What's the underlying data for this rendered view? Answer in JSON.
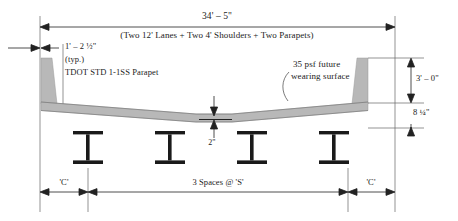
{
  "drawing": {
    "title_top_dimension": "34' – 5\"",
    "title_top_description": "(Two 12' Lanes + Two 4' Shoulders + Two Parapets)",
    "parapet_width_dimension": "1' – 2 ½\"",
    "parapet_typ_note": "(typ.)",
    "parapet_standard_note": "TDOT STD 1-1SS Parapet",
    "wearing_surface_note_line1": "35 psf future",
    "wearing_surface_note_line2": "wearing surface",
    "parapet_height_dimension": "3' – 0\"",
    "deck_thickness_dimension": "8 ¼\"",
    "crown_dimension": "2\"",
    "overhang_left_label": "'C'",
    "overhang_right_label": "'C'",
    "girder_spacing_label": "3 Spaces @ 'S'"
  },
  "colors": {
    "line": "#222222",
    "concrete_fill": "#b8b8b8",
    "girder_fill": "#1a1a1a",
    "extension_line": "#555555",
    "background": "#ffffff"
  }
}
